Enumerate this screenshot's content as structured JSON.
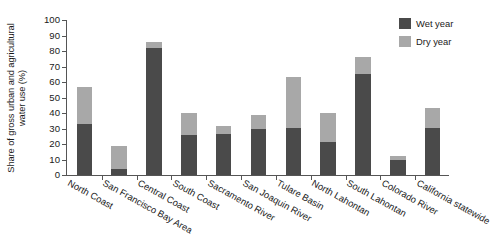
{
  "chart_data": {
    "type": "bar",
    "subtype": "stacked-vertical",
    "title": "",
    "xlabel": "",
    "ylabel": "Share of gross urban and agricultural water use (%)",
    "ylim": [
      0,
      100
    ],
    "yticks": [
      0,
      10,
      20,
      30,
      40,
      50,
      60,
      70,
      80,
      90,
      100
    ],
    "ytick_labels": [
      "0",
      "10",
      "20",
      "30",
      "40",
      "50",
      "60",
      "70",
      "80",
      "90",
      "100"
    ],
    "grid": false,
    "legend_position": "top-right",
    "categories": [
      "North Coast",
      "San Francisco Bay Area",
      "Central Coast",
      "South Coast",
      "Sacramento River",
      "San Joaquin River",
      "Tulare Basin",
      "North Lahontan",
      "South Lahontan",
      "Colorado River",
      "California statewide"
    ],
    "series": [
      {
        "name": "Wet year",
        "color": "#4a4a4a",
        "values": [
          33,
          4,
          82,
          26,
          26.5,
          30,
          30.5,
          21,
          65,
          10,
          30.5
        ]
      },
      {
        "name": "Dry year",
        "color": "#a8a8a8",
        "values": [
          24,
          15,
          4,
          14,
          5,
          8.5,
          32.5,
          19,
          11,
          2,
          12.5
        ]
      }
    ],
    "stack_totals": [
      57,
      19,
      86,
      40,
      31.5,
      38.5,
      63,
      40,
      76,
      12,
      43
    ]
  },
  "legend": {
    "items": [
      {
        "label": "Wet year",
        "color": "#4a4a4a"
      },
      {
        "label": "Dry year",
        "color": "#a8a8a8"
      }
    ]
  },
  "axis": {
    "y_title": "Share of gross urban and agricultural water use (%)"
  },
  "title_strip": ""
}
